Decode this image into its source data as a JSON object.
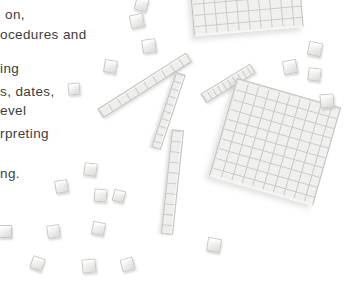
{
  "page": {
    "width": 344,
    "height": 288,
    "background": "#ffffff"
  },
  "text_column": {
    "color": "#3c3c3c",
    "font_size_px": 13.5,
    "fragments": [
      {
        "text": "on,",
        "x": 5,
        "y": 8
      },
      {
        "text": "ocedures and",
        "x": 0,
        "y": 28
      },
      {
        "text": "ing",
        "x": 0,
        "y": 62
      },
      {
        "text": "s, dates,",
        "x": 0,
        "y": 85
      },
      {
        "text": "evel",
        "x": 0,
        "y": 104
      },
      {
        "text": "rpreting",
        "x": 0,
        "y": 127
      },
      {
        "text": "ng.",
        "x": 0,
        "y": 167
      }
    ]
  },
  "blocks_photo": {
    "colors": {
      "block_fill": "#f0f0ee",
      "grid_line": "#c9c9c7",
      "rod_fill": "#eeeeec"
    },
    "flats": [
      {
        "name": "hundreds-flat-top",
        "x": 189,
        "y": -80,
        "w": 110,
        "h": 112,
        "rotation": -5,
        "cols": 10,
        "rows": 10
      },
      {
        "name": "hundreds-flat-center",
        "x": 221,
        "y": 91,
        "w": 108,
        "h": 102,
        "rotation": 16,
        "cols": 10,
        "rows": 10
      }
    ],
    "rods": [
      {
        "name": "tens-rod-hidden",
        "cx": 227.5,
        "cy": 83,
        "len": 58,
        "w": 11,
        "angle": -31.5,
        "behind": true,
        "segments": 10
      },
      {
        "name": "tens-rod-diagonal",
        "cx": 144,
        "cy": 85,
        "len": 105,
        "w": 11,
        "angle": -32.5,
        "behind": false,
        "segments": 10
      },
      {
        "name": "tens-rod-upper",
        "cx": 168.5,
        "cy": 110.5,
        "len": 79,
        "w": 10,
        "angle": 108.4,
        "behind": false,
        "segments": 10
      },
      {
        "name": "tens-rod-lower",
        "cx": 172.5,
        "cy": 182,
        "len": 105,
        "w": 12,
        "angle": 96,
        "behind": false,
        "segments": 10
      }
    ],
    "cubes": [
      {
        "x": 141,
        "y": 4,
        "s": 13,
        "r": 15
      },
      {
        "x": 137,
        "y": 21,
        "s": 14,
        "r": -12
      },
      {
        "x": 149,
        "y": 46,
        "s": 14,
        "r": -8
      },
      {
        "x": 110,
        "y": 66,
        "s": 13,
        "r": 10
      },
      {
        "x": 74,
        "y": 89,
        "s": 12,
        "r": -5
      },
      {
        "x": 315,
        "y": 49,
        "s": 14,
        "r": 12
      },
      {
        "x": 290,
        "y": 67,
        "s": 14,
        "r": -10
      },
      {
        "x": 314,
        "y": 74,
        "s": 13,
        "r": 8
      },
      {
        "x": 327,
        "y": 101,
        "s": 14,
        "r": -5
      },
      {
        "x": 90,
        "y": 169,
        "s": 13,
        "r": 8
      },
      {
        "x": 61,
        "y": 186,
        "s": 13,
        "r": -10
      },
      {
        "x": 100,
        "y": 195,
        "s": 13,
        "r": 5
      },
      {
        "x": 119,
        "y": 196,
        "s": 12,
        "r": 15
      },
      {
        "x": 5,
        "y": 231,
        "s": 13,
        "r": 0
      },
      {
        "x": 53,
        "y": 231,
        "s": 13,
        "r": -8
      },
      {
        "x": 98,
        "y": 228,
        "s": 13,
        "r": 12
      },
      {
        "x": 37,
        "y": 263,
        "s": 13,
        "r": 20
      },
      {
        "x": 89,
        "y": 266,
        "s": 14,
        "r": -6
      },
      {
        "x": 214,
        "y": 245,
        "s": 14,
        "r": 10
      },
      {
        "x": 127,
        "y": 264,
        "s": 13,
        "r": -15
      }
    ]
  }
}
